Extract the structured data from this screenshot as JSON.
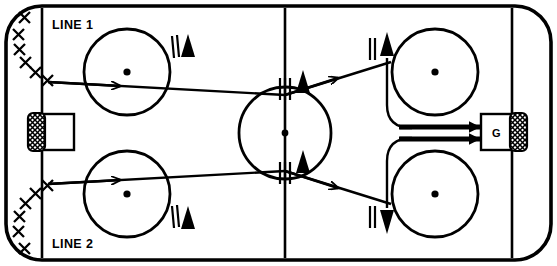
{
  "diagram": {
    "type": "ice-hockey-drill",
    "surface_color": "#ffffff",
    "line_color": "#000000"
  },
  "labels": {
    "line1": "LINE 1",
    "line2": "LINE 2",
    "goalie": "G"
  },
  "rink": {
    "width": 557,
    "height": 266,
    "border_inset": 6,
    "corner_radius": 36,
    "goal_line_left_x": 42,
    "goal_line_right_x": 512,
    "center_line_x": 285,
    "center_circle": {
      "cx": 285,
      "cy": 133,
      "r": 46
    }
  },
  "faceoff_circles": [
    {
      "name": "top-left-faceoff-circle",
      "cx": 127,
      "cy": 72,
      "r": 43
    },
    {
      "name": "bottom-left-faceoff-circle",
      "cx": 127,
      "cy": 194,
      "r": 43
    },
    {
      "name": "top-right-faceoff-circle",
      "cx": 435,
      "cy": 72,
      "r": 43
    },
    {
      "name": "bottom-right-faceoff-circle",
      "cx": 435,
      "cy": 194,
      "r": 43
    }
  ],
  "goals": [
    {
      "name": "left-goal",
      "x": 30,
      "y": 114,
      "width": 42,
      "height": 38,
      "net_side": "left"
    },
    {
      "name": "right-goal",
      "x": 492,
      "y": 114,
      "width": 42,
      "height": 38,
      "net_side": "right",
      "label": "G"
    }
  ],
  "player_queues": [
    {
      "name": "line-1-player-queue",
      "label": "LINE 1",
      "count": 6,
      "marker": "X",
      "positions": [
        [
          24,
          17
        ],
        [
          18,
          34
        ],
        [
          19,
          49
        ],
        [
          25,
          62
        ],
        [
          35,
          72
        ],
        [
          47,
          80
        ]
      ]
    },
    {
      "name": "line-2-player-queue",
      "label": "LINE 2",
      "count": 6,
      "marker": "X",
      "positions": [
        [
          47,
          186
        ],
        [
          35,
          194
        ],
        [
          25,
          204
        ],
        [
          19,
          217
        ],
        [
          18,
          232
        ],
        [
          24,
          249
        ]
      ]
    }
  ],
  "cones": [
    {
      "name": "cone-top-left",
      "x": 186,
      "y": 48
    },
    {
      "name": "cone-bottom-left",
      "x": 186,
      "y": 218
    },
    {
      "name": "cone-center-top",
      "x": 302,
      "y": 85
    },
    {
      "name": "cone-center-bottom",
      "x": 302,
      "y": 168
    },
    {
      "name": "cone-top-right",
      "x": 383,
      "y": 48
    },
    {
      "name": "cone-bottom-right",
      "x": 383,
      "y": 218
    }
  ],
  "movement_paths": [
    {
      "name": "line-1-skate-path-segment-1",
      "from": [
        45,
        80
      ],
      "to": [
        285,
        95
      ],
      "arrow": true
    },
    {
      "name": "line-1-skate-path-segment-2",
      "from": [
        285,
        95
      ],
      "to": [
        390,
        63
      ],
      "arrow": true
    },
    {
      "name": "line-2-skate-path-segment-1",
      "from": [
        45,
        186
      ],
      "to": [
        285,
        171
      ],
      "arrow": true
    },
    {
      "name": "line-2-skate-path-segment-2",
      "from": [
        285,
        171
      ],
      "to": [
        390,
        203
      ],
      "arrow": true
    },
    {
      "name": "shot-path-upper",
      "from": [
        398,
        127
      ],
      "to": [
        492,
        127
      ],
      "arrow": true
    },
    {
      "name": "shot-path-lower",
      "from": [
        398,
        139
      ],
      "to": [
        492,
        139
      ],
      "arrow": true
    }
  ]
}
